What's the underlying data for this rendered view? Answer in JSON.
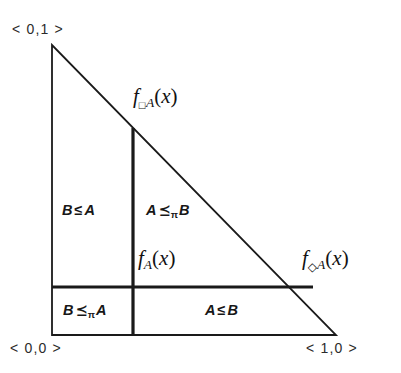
{
  "figure": {
    "kind": "geometric-region-diagram",
    "shape": "right-triangle",
    "background_color": "#ffffff",
    "line_color": "#1a1a1a"
  },
  "corners": [
    {
      "name": "top-left-vertex",
      "text": "< 0,1 >"
    },
    {
      "name": "bottom-left-vertex",
      "text": "< 0,0 >"
    },
    {
      "name": "bottom-right-vertex",
      "text": "< 1,0 >"
    }
  ],
  "regions": [
    {
      "name": "upper-left-region",
      "left": "B",
      "relation": "≤",
      "sub": "",
      "right": "A"
    },
    {
      "name": "upper-right-region",
      "left": "A",
      "relation": "⪯",
      "sub": "π",
      "right": "B"
    },
    {
      "name": "lower-left-region",
      "left": "B",
      "relation": "⪯",
      "sub": "π",
      "right": "A"
    },
    {
      "name": "lower-right-region",
      "left": "A",
      "relation": "≤",
      "sub": "",
      "right": "B"
    }
  ],
  "functions": [
    {
      "name": "box-function-label",
      "f": "f",
      "op": "□",
      "base": "A",
      "open": "(",
      "arg": "x",
      "close": ")"
    },
    {
      "name": "plain-function-label",
      "f": "f",
      "op": "",
      "base": "A",
      "open": "(",
      "arg": "x",
      "close": ")"
    },
    {
      "name": "diamond-function-label",
      "f": "f",
      "op": "◇",
      "base": "A",
      "open": "(",
      "arg": "x",
      "close": ")"
    }
  ],
  "geometry": {
    "apex": {
      "x": 52,
      "y": 45
    },
    "bottom_left": {
      "x": 52,
      "y": 335
    },
    "bottom_right": {
      "x": 336,
      "y": 335
    },
    "vertical_divider": {
      "x": 133,
      "y_top": 128,
      "y_bottom": 335
    },
    "horizontal_divider": {
      "y": 287,
      "x_left": 52,
      "x_right": 313
    }
  }
}
